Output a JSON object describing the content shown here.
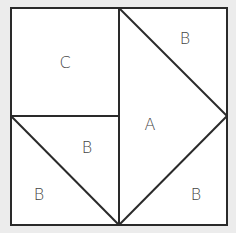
{
  "diagram": {
    "colors": {
      "background": "#ececec",
      "fill": "#ffffff",
      "stroke": "#2a2a2a",
      "text": "#444444"
    },
    "labels": {
      "region_c": "C",
      "region_b_top_right": "B",
      "region_a": "A",
      "region_b_middle": "B",
      "region_b_bottom_left": "B",
      "region_b_bottom_right": "B"
    }
  }
}
